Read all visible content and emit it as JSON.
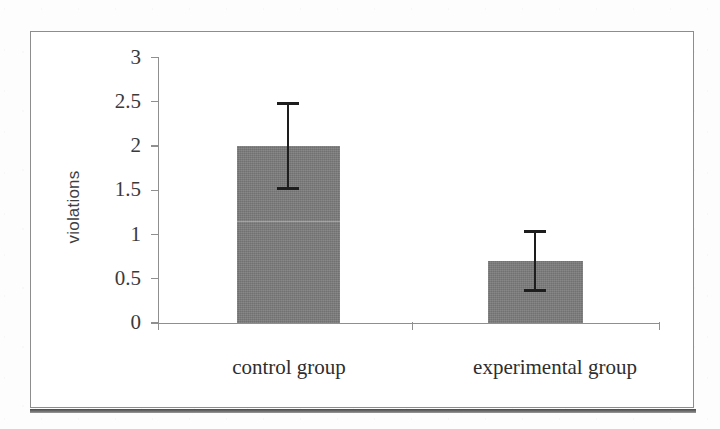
{
  "figure": {
    "background_color": "#ffffff",
    "frame_color": "#8d8d8d",
    "bar_color": "#7c7c7c",
    "error_bar_color": "#1d1d1d",
    "axis_color": "#8f8f8f"
  },
  "chart_data": {
    "type": "bar",
    "title": "",
    "xlabel": "",
    "ylabel": "violations",
    "categories": [
      "control group",
      "experimental group"
    ],
    "values": [
      2,
      0.7
    ],
    "errors_low": [
      1.5,
      0.35
    ],
    "errors_high": [
      2.5,
      1.05
    ],
    "ylim": [
      0,
      3
    ],
    "yticks": [
      0,
      0.5,
      1,
      1.5,
      2,
      2.5,
      3
    ],
    "ytick_labels": [
      "0",
      "0.5",
      "1",
      "1.5",
      "2",
      "2.5",
      "3"
    ],
    "grid": false,
    "legend": null,
    "annotations": []
  }
}
